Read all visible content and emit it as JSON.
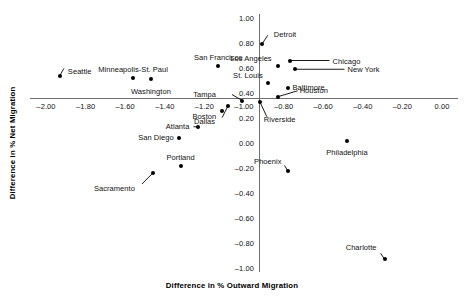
{
  "chart_data": {
    "type": "scatter",
    "title": "",
    "xlabel": "Difference in % Outward Migration",
    "ylabel": "Difference in % Net Migration",
    "xlim": [
      -2.1,
      0.05
    ],
    "ylim": [
      -1.05,
      1.05
    ],
    "grid": false,
    "legend": "none",
    "x_ticks": [
      "-2.00",
      "-1.80",
      "-1.60",
      "-1.40",
      "-1.20",
      "-1.00",
      "-0.80",
      "-0.60",
      "-0.40",
      "-0.20",
      "0.00"
    ],
    "x_tick_values": [
      -2.0,
      -1.8,
      -1.6,
      -1.4,
      -1.2,
      -1.0,
      -0.8,
      -0.6,
      -0.4,
      -0.2,
      0.0
    ],
    "y_ticks": [
      "1.00",
      "0.80",
      "0.60",
      "0.40",
      "0.20",
      "0.00",
      "-0.20",
      "-0.40",
      "-0.60",
      "-0.80",
      "-1.00"
    ],
    "y_tick_values": [
      1.0,
      0.8,
      0.6,
      0.4,
      0.2,
      0.0,
      -0.2,
      -0.4,
      -0.6,
      -0.8,
      -1.0
    ],
    "axis_origin": [
      -0.92,
      0.34
    ],
    "points": [
      {
        "label": "Seattle",
        "x": -1.93,
        "y": 0.54
      },
      {
        "label": "Minneapolis-St. Paul",
        "x": -1.56,
        "y": 0.52
      },
      {
        "label": "Washington",
        "x": -1.47,
        "y": 0.51
      },
      {
        "label": "San Francisco",
        "x": -1.13,
        "y": 0.62
      },
      {
        "label": "Detroit",
        "x": -0.91,
        "y": 0.79
      },
      {
        "label": "Los Angeles",
        "x": -0.83,
        "y": 0.62
      },
      {
        "label": "Chicago",
        "x": -0.77,
        "y": 0.66
      },
      {
        "label": "New York",
        "x": -0.74,
        "y": 0.59
      },
      {
        "label": "St. Louis",
        "x": -0.88,
        "y": 0.48
      },
      {
        "label": "Baltimore",
        "x": -0.78,
        "y": 0.44
      },
      {
        "label": "Houston",
        "x": -0.83,
        "y": 0.37
      },
      {
        "label": "Tampa",
        "x": -1.01,
        "y": 0.34
      },
      {
        "label": "Riverside",
        "x": -0.92,
        "y": 0.33
      },
      {
        "label": "Boston",
        "x": -1.11,
        "y": 0.26
      },
      {
        "label": "Dallas",
        "x": -1.08,
        "y": 0.3
      },
      {
        "label": "Atlanta",
        "x": -1.23,
        "y": 0.13
      },
      {
        "label": "San Diego",
        "x": -1.33,
        "y": 0.04
      },
      {
        "label": "Portland",
        "x": -1.32,
        "y": -0.18
      },
      {
        "label": "Sacramento",
        "x": -1.46,
        "y": -0.24
      },
      {
        "label": "Phoenix",
        "x": -0.78,
        "y": -0.22
      },
      {
        "label": "Philadelphia",
        "x": -0.48,
        "y": 0.02
      },
      {
        "label": "Charlotte",
        "x": -0.29,
        "y": -0.93
      }
    ]
  },
  "axes": {
    "x_title": "Difference in % Outward Migration",
    "y_title": "Difference in % Net Migration"
  },
  "x_tick_labels": [
    {
      "text": "-2.00"
    },
    {
      "text": "-1.80"
    },
    {
      "text": "-1.60"
    },
    {
      "text": "-1.40"
    },
    {
      "text": "-1.20"
    },
    {
      "text": "-1.00"
    },
    {
      "text": "-0.80"
    },
    {
      "text": "-0.60"
    },
    {
      "text": "-0.40"
    },
    {
      "text": "-0.20"
    },
    {
      "text": "0.00"
    }
  ],
  "y_tick_labels": [
    {
      "text": "1.00"
    },
    {
      "text": "0.80"
    },
    {
      "text": "0.60"
    },
    {
      "text": "0.40"
    },
    {
      "text": "0.20"
    },
    {
      "text": "0.00"
    },
    {
      "text": "-0.20"
    },
    {
      "text": "-0.40"
    },
    {
      "text": "-0.60"
    },
    {
      "text": "-0.80"
    },
    {
      "text": "-1.00"
    }
  ],
  "colors": {
    "point": "#000000",
    "axis": "#6e6e6e",
    "text": "#111111",
    "background": "#ffffff"
  }
}
